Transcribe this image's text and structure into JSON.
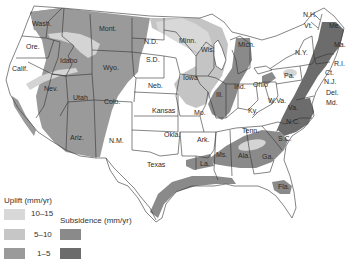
{
  "map": {
    "type": "choropleth-overlay",
    "subject": "Vertical crustal movement in the United States",
    "state_labels": [
      {
        "id": "wash",
        "text": "Wash.",
        "x": 32,
        "y": 26
      },
      {
        "id": "ore",
        "text": "Ore.",
        "x": 26,
        "y": 49
      },
      {
        "id": "calif",
        "text": "Calif.",
        "x": 12,
        "y": 71
      },
      {
        "id": "idaho",
        "text": "Idaho",
        "x": 60,
        "y": 63
      },
      {
        "id": "nev",
        "text": "Nev.",
        "x": 44,
        "y": 91
      },
      {
        "id": "mont",
        "text": "Mont.",
        "x": 99,
        "y": 31
      },
      {
        "id": "wyo",
        "text": "Wyo.",
        "x": 103,
        "y": 70
      },
      {
        "id": "utah",
        "text": "Utah",
        "x": 73,
        "y": 100
      },
      {
        "id": "colo",
        "text": "Colo.",
        "x": 104,
        "y": 104
      },
      {
        "id": "ariz",
        "text": "Ariz.",
        "x": 70,
        "y": 140
      },
      {
        "id": "nm",
        "text": "N.M.",
        "x": 109,
        "y": 143
      },
      {
        "id": "nd",
        "text": "N.D.",
        "x": 144,
        "y": 44
      },
      {
        "id": "sd",
        "text": "S.D.",
        "x": 146,
        "y": 62
      },
      {
        "id": "neb",
        "text": "Neb.",
        "x": 148,
        "y": 88
      },
      {
        "id": "kansas",
        "text": "Kansas",
        "x": 152,
        "y": 113
      },
      {
        "id": "okla",
        "text": "Okla.",
        "x": 164,
        "y": 137
      },
      {
        "id": "texas",
        "text": "Texas",
        "x": 147,
        "y": 167
      },
      {
        "id": "minn",
        "text": "Minn.",
        "x": 179,
        "y": 43
      },
      {
        "id": "iowa",
        "text": "Iowa",
        "x": 183,
        "y": 80
      },
      {
        "id": "mo",
        "text": "Mo.",
        "x": 194,
        "y": 115
      },
      {
        "id": "ark",
        "text": "Ark.",
        "x": 197,
        "y": 142
      },
      {
        "id": "la",
        "text": "La.",
        "x": 200,
        "y": 166
      },
      {
        "id": "wis",
        "text": "Wis.",
        "x": 201,
        "y": 52
      },
      {
        "id": "ill",
        "text": "Ill.",
        "x": 216,
        "y": 97
      },
      {
        "id": "mich",
        "text": "Mich.",
        "x": 238,
        "y": 47
      },
      {
        "id": "ind",
        "text": "Ind.",
        "x": 234,
        "y": 89
      },
      {
        "id": "ohio",
        "text": "Ohio",
        "x": 253,
        "y": 87
      },
      {
        "id": "ky",
        "text": "Ky.",
        "x": 248,
        "y": 113
      },
      {
        "id": "tenn",
        "text": "Tenn.",
        "x": 242,
        "y": 133
      },
      {
        "id": "ms",
        "text": "Ms.",
        "x": 216,
        "y": 157
      },
      {
        "id": "ala",
        "text": "Ala.",
        "x": 238,
        "y": 158
      },
      {
        "id": "ga",
        "text": "Ga.",
        "x": 262,
        "y": 159
      },
      {
        "id": "fla",
        "text": "Fla.",
        "x": 278,
        "y": 189
      },
      {
        "id": "sc",
        "text": "S.C.",
        "x": 278,
        "y": 141
      },
      {
        "id": "nc",
        "text": "N.C.",
        "x": 286,
        "y": 124
      },
      {
        "id": "va",
        "text": "Va.",
        "x": 288,
        "y": 110
      },
      {
        "id": "wva",
        "text": "W.Va.",
        "x": 268,
        "y": 103
      },
      {
        "id": "pa",
        "text": "Pa.",
        "x": 284,
        "y": 78
      },
      {
        "id": "ny",
        "text": "N.Y.",
        "x": 295,
        "y": 55
      },
      {
        "id": "vt",
        "text": "Vt.",
        "x": 304,
        "y": 28
      },
      {
        "id": "nh",
        "text": "N.H.",
        "x": 303,
        "y": 17
      },
      {
        "id": "me",
        "text": "Me.",
        "x": 329,
        "y": 28
      },
      {
        "id": "ma",
        "text": "Ma.",
        "x": 334,
        "y": 47
      },
      {
        "id": "ri",
        "text": "R.I.",
        "x": 334,
        "y": 66
      },
      {
        "id": "ct",
        "text": "Ct.",
        "x": 325,
        "y": 75
      },
      {
        "id": "nj",
        "text": "N.J.",
        "x": 324,
        "y": 84
      },
      {
        "id": "del",
        "text": "Del.",
        "x": 326,
        "y": 95
      },
      {
        "id": "md",
        "text": "Md.",
        "x": 326,
        "y": 105
      }
    ]
  },
  "legend": {
    "uplift_title": "Uplift (mm/yr)",
    "subsidence_title": "Subsidence (mm/yr)",
    "uplift": [
      {
        "range": "10–15",
        "color": "#d8d8d8"
      },
      {
        "range": "5–10",
        "color": "#c6c6c6"
      },
      {
        "range": "1–5",
        "color": "#9a9a9a"
      }
    ],
    "subsidence": [
      {
        "range": "5–10",
        "color": "#8a8a8a"
      },
      {
        "range": "1–5",
        "color": "#6c6c6c"
      }
    ]
  },
  "colors": {
    "background": "#ffffff",
    "land": "#ffffff",
    "uplift_high": "#d8d8d8",
    "uplift_mid": "#c4c4c4",
    "uplift_low": "#9a9a9a",
    "subsidence_mid": "#8a8a8a",
    "subsidence_high": "#6c6c6c",
    "border": "#333333"
  }
}
